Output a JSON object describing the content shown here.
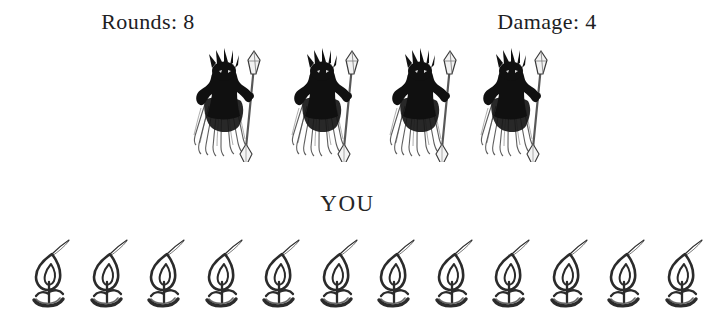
{
  "screen": {
    "title": "Battle Screen",
    "background_color": "#ffffff",
    "ink_color": "#1a1a1a"
  },
  "status_bar": {
    "rounds": {
      "label": "Rounds:",
      "value": "8",
      "text": "Rounds: 8"
    },
    "damage": {
      "label": "Damage:",
      "value": "4",
      "text": "Damage: 4"
    }
  },
  "enemies": {
    "icon_name": "horned-demon-with-staff-icon",
    "count": 4,
    "fill_color": "#101010",
    "positions": [
      183,
      281,
      379,
      470
    ]
  },
  "player": {
    "label": "YOU"
  },
  "lives": {
    "icon_name": "flame-icon",
    "count": 12,
    "stroke_color": "#2b2b2b",
    "start_x": 27,
    "step": 57.5
  }
}
